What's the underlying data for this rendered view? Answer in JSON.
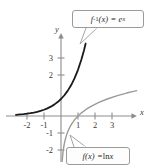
{
  "figure": {
    "name": "graph-of-natural-log-and-exponential-inverse-functions"
  },
  "axes": {
    "x_axis_label": "x",
    "y_axis_label": "y",
    "x_tick_labels": [
      "-2",
      "-1",
      "1",
      "2",
      "3"
    ],
    "y_tick_labels": [
      "3",
      "2",
      "-1",
      "-2"
    ]
  },
  "callouts": {
    "inverse": {
      "f_part": "f",
      "exponent": "-1",
      "arg_part": "(x) = e",
      "exp_var": "x",
      "full_text": "f^-1(x) = e^x"
    },
    "log": {
      "f_part": "f",
      "arg_part": "(x) = ",
      "ln_part": "ln ",
      "var_part": "x",
      "full_text": "f(x) = ln x"
    }
  },
  "colors": {
    "exponential_curve": "#1a1a1a",
    "log_curve": "#9b9b9b",
    "axis": "#8d8d8d",
    "callout_border": "#9a9a9a",
    "text": "#3a3a3a",
    "background": "#ffffff"
  },
  "chart_data": {
    "type": "line",
    "title": "",
    "xlabel": "x",
    "ylabel": "y",
    "xlim": [
      -2.6,
      4.5
    ],
    "ylim": [
      -2.6,
      4.6
    ],
    "grid": false,
    "legend": "callouts",
    "x_ticks": [
      -2,
      -1,
      1,
      2,
      3
    ],
    "y_ticks": [
      3,
      2,
      -1,
      -2
    ],
    "origin_px": [
      61,
      116
    ],
    "unit_px": 17,
    "series": [
      {
        "name": "f^-1(x) = e^x",
        "formula": "e^x",
        "color": "#1a1a1a",
        "stroke_width": 1.8,
        "x_domain": [
          -2.65,
          1.45
        ],
        "points": [
          [
            -2.65,
            0.07
          ],
          [
            -2.4,
            0.09
          ],
          [
            -2.2,
            0.11
          ],
          [
            -2.0,
            0.135
          ],
          [
            -1.8,
            0.165
          ],
          [
            -1.6,
            0.2
          ],
          [
            -1.4,
            0.247
          ],
          [
            -1.2,
            0.301
          ],
          [
            -1.0,
            0.368
          ],
          [
            -0.8,
            0.449
          ],
          [
            -0.6,
            0.549
          ],
          [
            -0.4,
            0.67
          ],
          [
            -0.2,
            0.819
          ],
          [
            0.0,
            1.0
          ],
          [
            0.2,
            1.221
          ],
          [
            0.4,
            1.492
          ],
          [
            0.6,
            1.822
          ],
          [
            0.8,
            2.226
          ],
          [
            1.0,
            2.718
          ],
          [
            1.2,
            3.32
          ],
          [
            1.35,
            3.857
          ],
          [
            1.45,
            4.263
          ]
        ]
      },
      {
        "name": "f(x) = ln x",
        "formula": "ln x",
        "color": "#9b9b9b",
        "stroke_width": 1.4,
        "x_domain": [
          0.07,
          4.45
        ],
        "points": [
          [
            0.07,
            -2.66
          ],
          [
            0.09,
            -2.41
          ],
          [
            0.11,
            -2.21
          ],
          [
            0.135,
            -2.0
          ],
          [
            0.165,
            -1.8
          ],
          [
            0.2,
            -1.61
          ],
          [
            0.247,
            -1.4
          ],
          [
            0.301,
            -1.2
          ],
          [
            0.368,
            -1.0
          ],
          [
            0.449,
            -0.8
          ],
          [
            0.549,
            -0.6
          ],
          [
            0.67,
            -0.4
          ],
          [
            0.819,
            -0.2
          ],
          [
            1.0,
            0.0
          ],
          [
            1.221,
            0.2
          ],
          [
            1.492,
            0.4
          ],
          [
            1.822,
            0.6
          ],
          [
            2.226,
            0.8
          ],
          [
            2.718,
            1.0
          ],
          [
            3.32,
            1.2
          ],
          [
            3.857,
            1.35
          ],
          [
            4.263,
            1.45
          ],
          [
            4.45,
            1.493
          ]
        ]
      }
    ],
    "annotations": [
      {
        "text": "f^-1(x) = e^x",
        "kind": "callout-box",
        "box_px": [
          72,
          10,
          72,
          18
        ],
        "tail_to_px": [
          80,
          44
        ]
      },
      {
        "text": "f(x) = ln x",
        "kind": "callout-box",
        "box_px": [
          66,
          147,
          64,
          18
        ],
        "tail_to_px": [
          70,
          136
        ]
      }
    ]
  }
}
